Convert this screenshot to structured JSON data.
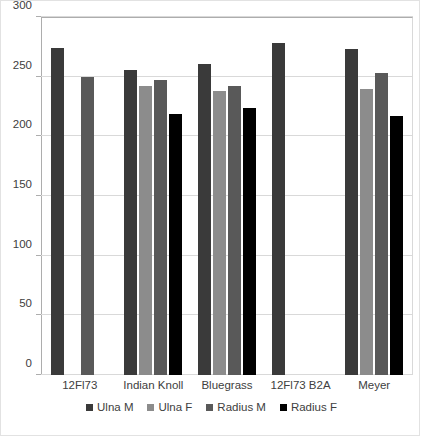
{
  "chart_data": {
    "type": "bar",
    "title": "",
    "xlabel": "",
    "ylabel": "",
    "ylim": [
      0,
      300
    ],
    "y_ticks": [
      0,
      50,
      100,
      150,
      200,
      250,
      300
    ],
    "y_tick_labels": [
      "0",
      "50",
      "100",
      "150",
      "200",
      "250",
      "300"
    ],
    "grid": true,
    "legend_position": "bottom",
    "categories": [
      "12Fl73",
      "Indian Knoll",
      "Bluegrass",
      "12Fl73 B2A",
      "Meyer"
    ],
    "series": [
      {
        "name": "Ulna M",
        "color": "#3a3a3a",
        "values": [
          274,
          256,
          261,
          278,
          273
        ]
      },
      {
        "name": "Ulna F",
        "color": "#8c8c8c",
        "values": [
          null,
          242,
          238,
          null,
          240
        ]
      },
      {
        "name": "Radius M",
        "color": "#595959",
        "values": [
          250,
          247,
          242,
          null,
          253
        ]
      },
      {
        "name": "Radius F",
        "color": "#000000",
        "values": [
          null,
          219,
          224,
          null,
          217
        ]
      }
    ]
  }
}
